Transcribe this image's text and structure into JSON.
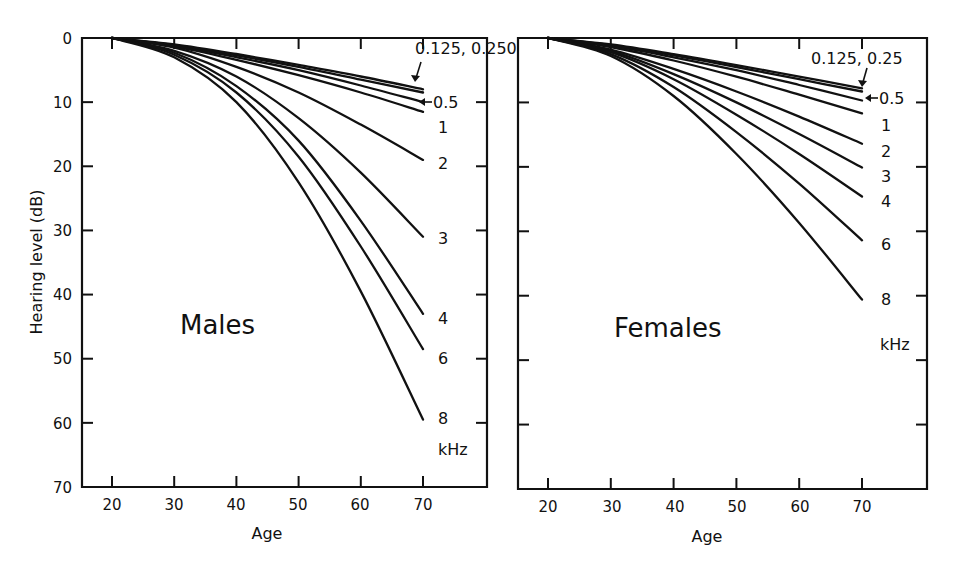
{
  "chart_data": [
    {
      "type": "line",
      "title": "Males",
      "xlabel": "Age",
      "ylabel": "Hearing level (dB)",
      "xlim": [
        15,
        80
      ],
      "ylim": [
        70,
        0
      ],
      "y_inverted": true,
      "x_ticks": [
        20,
        30,
        40,
        50,
        60,
        70
      ],
      "y_ticks": [
        0,
        10,
        20,
        30,
        40,
        50,
        60,
        70
      ],
      "grid": false,
      "legend": "inline labels at curve ends (kHz)",
      "unit_label": "kHz",
      "x": [
        20,
        30,
        40,
        50,
        60,
        70
      ],
      "series": [
        {
          "name": "0.125",
          "values": [
            0,
            1.0,
            2.5,
            4.2,
            6.0,
            8.0
          ]
        },
        {
          "name": "0.250",
          "values": [
            0,
            1.1,
            2.7,
            4.5,
            6.5,
            8.5
          ]
        },
        {
          "name": "0.5",
          "values": [
            0,
            1.2,
            3.0,
            5.0,
            7.4,
            10.0
          ]
        },
        {
          "name": "1",
          "values": [
            0,
            1.3,
            3.4,
            5.8,
            8.5,
            11.5
          ]
        },
        {
          "name": "2",
          "values": [
            0,
            1.5,
            4.5,
            8.5,
            13.5,
            19.0
          ]
        },
        {
          "name": "3",
          "values": [
            0,
            2.0,
            6.0,
            12.5,
            21.0,
            31.0
          ]
        },
        {
          "name": "4",
          "values": [
            0,
            2.3,
            7.5,
            16.0,
            28.5,
            43.0
          ]
        },
        {
          "name": "6",
          "values": [
            0,
            2.6,
            8.5,
            18.5,
            32.5,
            48.5
          ]
        },
        {
          "name": "8",
          "values": [
            0,
            3.0,
            10.0,
            22.5,
            39.5,
            59.5
          ]
        }
      ]
    },
    {
      "type": "line",
      "title": "Females",
      "xlabel": "Age",
      "ylabel": "Hearing level (dB)",
      "xlim": [
        15,
        80
      ],
      "ylim": [
        70,
        0
      ],
      "y_inverted": true,
      "x_ticks": [
        20,
        30,
        40,
        50,
        60,
        70
      ],
      "y_ticks": [
        0,
        10,
        20,
        30,
        40,
        50,
        60,
        70
      ],
      "grid": false,
      "legend": "inline labels at curve ends (kHz)",
      "unit_label": "kHz",
      "x": [
        20,
        30,
        40,
        50,
        60,
        70
      ],
      "series": [
        {
          "name": "0.125",
          "values": [
            0,
            1.0,
            2.5,
            4.2,
            6.0,
            7.8
          ]
        },
        {
          "name": "0.25",
          "values": [
            0,
            1.1,
            2.7,
            4.5,
            6.4,
            8.3
          ]
        },
        {
          "name": "0.5",
          "values": [
            0,
            1.2,
            3.0,
            5.0,
            7.3,
            9.7
          ]
        },
        {
          "name": "1",
          "values": [
            0,
            1.4,
            3.5,
            6.0,
            8.8,
            11.7
          ]
        },
        {
          "name": "2",
          "values": [
            0,
            1.8,
            4.8,
            8.3,
            12.2,
            16.4
          ]
        },
        {
          "name": "3",
          "values": [
            0,
            2.0,
            5.6,
            10.0,
            14.9,
            20.1
          ]
        },
        {
          "name": "4",
          "values": [
            0,
            2.2,
            6.4,
            11.9,
            18.0,
            24.6
          ]
        },
        {
          "name": "6",
          "values": [
            0,
            2.5,
            7.6,
            14.6,
            22.6,
            31.4
          ]
        },
        {
          "name": "8",
          "values": [
            0,
            2.8,
            9.0,
            18.0,
            28.7,
            40.6
          ]
        }
      ]
    }
  ],
  "figure": {
    "ylabel": "Hearing level (dB)",
    "males": {
      "title": "Males",
      "xlabel": "Age",
      "x_tick_labels": [
        "20",
        "30",
        "40",
        "50",
        "60",
        "70"
      ],
      "y_tick_labels": [
        "0",
        "10",
        "20",
        "30",
        "40",
        "50",
        "60",
        "70"
      ],
      "end_labels": {
        "low": "0.125, 0.250",
        "half": "0.5",
        "one": "1",
        "two": "2",
        "three": "3",
        "four": "4",
        "six": "6",
        "eight": "8",
        "unit": "kHz"
      }
    },
    "females": {
      "title": "Females",
      "xlabel": "Age",
      "x_tick_labels": [
        "20",
        "30",
        "40",
        "50",
        "60",
        "70"
      ],
      "end_labels": {
        "low": "0.125, 0.25",
        "half": "0.5",
        "one": "1",
        "two": "2",
        "three": "3",
        "four": "4",
        "six": "6",
        "eight": "8",
        "unit": "kHz"
      }
    }
  }
}
